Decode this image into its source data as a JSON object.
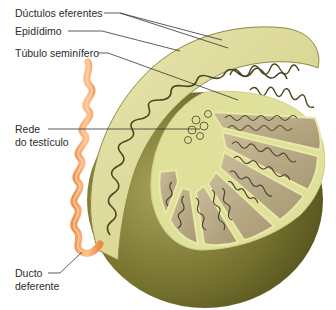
{
  "figure": {
    "labels": [
      {
        "id": "ductulos-eferentes",
        "text": "Dúctulos eferentes"
      },
      {
        "id": "epididimo",
        "text": "Epidídimo"
      },
      {
        "id": "tubulo-seminifero",
        "text": "Túbulo seminífero"
      },
      {
        "id": "rede-testiculo",
        "line1": "Rede",
        "line2": "do testículo"
      },
      {
        "id": "ducto-deferente",
        "line1": "Ducto",
        "line2": "deferente"
      }
    ],
    "colors": {
      "background": "#ffffff",
      "tunica": "#6b6a2e",
      "tunica_light": "#a9a55a",
      "epididymis": "#e3e0a4",
      "lobule": "#b8a98a",
      "tubule": "#4f4630",
      "septum": "#e6e6a0",
      "vas_deferens": "#f5a56a",
      "leader_line": "#333333",
      "text": "#2b2b2b"
    }
  }
}
